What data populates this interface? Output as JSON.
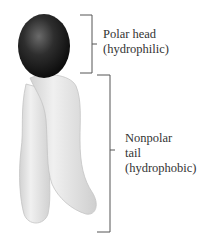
{
  "diagram": {
    "head": {
      "line1": "Polar head",
      "line2": "(hydrophilic)",
      "fill": "#1a1a1a"
    },
    "tail": {
      "line1": "Nonpolar",
      "line2": "tail",
      "line3": "(hydrophobic)",
      "fill": "#e6e6e6"
    },
    "bracket_color": "#555555"
  }
}
